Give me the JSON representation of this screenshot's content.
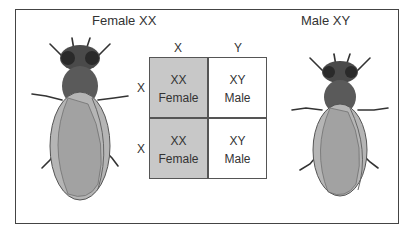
{
  "labels": {
    "female": "Female XX",
    "male": "Male XY"
  },
  "punnett": {
    "columns": [
      "X",
      "Y"
    ],
    "rows": [
      "X",
      "X"
    ],
    "cells": [
      [
        {
          "genotype": "XX",
          "sex": "Female",
          "color": "#c8c8c8"
        },
        {
          "genotype": "XY",
          "sex": "Male",
          "color": "#ffffff"
        }
      ],
      [
        {
          "genotype": "XX",
          "sex": "Female",
          "color": "#c8c8c8"
        },
        {
          "genotype": "XY",
          "sex": "Male",
          "color": "#ffffff"
        }
      ]
    ]
  },
  "icons": {
    "female_fly": "fruit-fly-female-icon",
    "male_fly": "fruit-fly-male-icon"
  }
}
